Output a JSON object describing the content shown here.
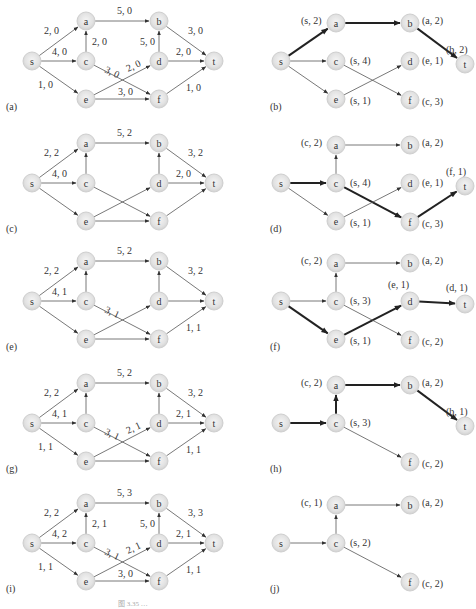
{
  "figure": {
    "caption": "图 3.35 …",
    "panels": [
      {
        "id": "a",
        "label": "(a)",
        "kind": "network",
        "origin": [
          0,
          0
        ],
        "edges": [
          {
            "from": "s",
            "to": "a",
            "label": "2, 0"
          },
          {
            "from": "s",
            "to": "c",
            "label": "4, 0"
          },
          {
            "from": "s",
            "to": "e",
            "label": "1, 0"
          },
          {
            "from": "c",
            "to": "a",
            "label": "2, 0"
          },
          {
            "from": "a",
            "to": "b",
            "label": "5, 0"
          },
          {
            "from": "c",
            "to": "f",
            "label": "3, 0"
          },
          {
            "from": "e",
            "to": "d",
            "label": "2, 0"
          },
          {
            "from": "e",
            "to": "f",
            "label": "3, 0"
          },
          {
            "from": "d",
            "to": "b",
            "label": "5, 0"
          },
          {
            "from": "b",
            "to": "t",
            "label": "3, 0"
          },
          {
            "from": "d",
            "to": "t",
            "label": "2, 0"
          },
          {
            "from": "f",
            "to": "t",
            "label": "1, 0"
          }
        ]
      },
      {
        "id": "b",
        "label": "(b)",
        "kind": "tree",
        "origin": [
          250,
          0
        ],
        "tags": {
          "a": "(s, 2)",
          "b": "(a, 2)",
          "t": "(b, 2)",
          "c": "(s, 4)",
          "d": "(e, 1)",
          "e": "(s, 1)",
          "f": "(c, 3)"
        },
        "nodes": [
          "s",
          "a",
          "b",
          "t",
          "c",
          "d",
          "e",
          "f"
        ],
        "edges": [
          {
            "from": "s",
            "to": "a",
            "bold": true
          },
          {
            "from": "a",
            "to": "b",
            "bold": true
          },
          {
            "from": "b",
            "to": "t",
            "bold": true
          },
          {
            "from": "s",
            "to": "c",
            "bold": false
          },
          {
            "from": "s",
            "to": "e",
            "bold": false
          },
          {
            "from": "c",
            "to": "f",
            "bold": false
          },
          {
            "from": "e",
            "to": "d",
            "bold": false
          }
        ]
      },
      {
        "id": "c",
        "label": "(c)",
        "kind": "network",
        "origin": [
          0,
          122
        ],
        "edges": [
          {
            "from": "s",
            "to": "a",
            "label": "2, 2"
          },
          {
            "from": "s",
            "to": "c",
            "label": "4, 0"
          },
          {
            "from": "s",
            "to": "e",
            "label": ""
          },
          {
            "from": "c",
            "to": "a",
            "label": ""
          },
          {
            "from": "a",
            "to": "b",
            "label": "5, 2"
          },
          {
            "from": "c",
            "to": "f",
            "label": ""
          },
          {
            "from": "e",
            "to": "d",
            "label": ""
          },
          {
            "from": "e",
            "to": "f",
            "label": ""
          },
          {
            "from": "d",
            "to": "b",
            "label": ""
          },
          {
            "from": "b",
            "to": "t",
            "label": "3, 2"
          },
          {
            "from": "d",
            "to": "t",
            "label": "2, 0"
          },
          {
            "from": "f",
            "to": "t",
            "label": ""
          }
        ]
      },
      {
        "id": "d",
        "label": "(d)",
        "kind": "tree",
        "origin": [
          250,
          122
        ],
        "tags": {
          "a": "(c, 2)",
          "b": "(a, 2)",
          "t": "(f, 1)",
          "c": "(s, 4)",
          "d": "(e, 1)",
          "e": "(s, 1)",
          "f": "(c, 3)"
        },
        "nodes": [
          "s",
          "a",
          "b",
          "t",
          "c",
          "d",
          "e",
          "f"
        ],
        "edges": [
          {
            "from": "s",
            "to": "c",
            "bold": true
          },
          {
            "from": "c",
            "to": "f",
            "bold": true
          },
          {
            "from": "f",
            "to": "t",
            "bold": true
          },
          {
            "from": "c",
            "to": "a",
            "bold": false
          },
          {
            "from": "a",
            "to": "b",
            "bold": false
          },
          {
            "from": "s",
            "to": "e",
            "bold": false
          },
          {
            "from": "e",
            "to": "d",
            "bold": false
          }
        ]
      },
      {
        "id": "e",
        "label": "(e)",
        "kind": "network",
        "origin": [
          0,
          240
        ],
        "edges": [
          {
            "from": "s",
            "to": "a",
            "label": "2, 2"
          },
          {
            "from": "s",
            "to": "c",
            "label": "4, 1"
          },
          {
            "from": "s",
            "to": "e",
            "label": ""
          },
          {
            "from": "c",
            "to": "a",
            "label": ""
          },
          {
            "from": "a",
            "to": "b",
            "label": "5, 2"
          },
          {
            "from": "c",
            "to": "f",
            "label": "3, 1"
          },
          {
            "from": "e",
            "to": "d",
            "label": ""
          },
          {
            "from": "e",
            "to": "f",
            "label": ""
          },
          {
            "from": "d",
            "to": "b",
            "label": ""
          },
          {
            "from": "b",
            "to": "t",
            "label": "3, 2"
          },
          {
            "from": "d",
            "to": "t",
            "label": ""
          },
          {
            "from": "f",
            "to": "t",
            "label": "1, 1"
          }
        ]
      },
      {
        "id": "f",
        "label": "(f)",
        "kind": "tree",
        "origin": [
          250,
          240
        ],
        "tags": {
          "a": "(c, 2)",
          "b": "(a, 2)",
          "t": "(d, 1)",
          "c": "(s, 3)",
          "d": "(e, 1)",
          "e": "(s, 1)",
          "f": "(c, 2)"
        },
        "nodes": [
          "s",
          "a",
          "b",
          "t",
          "c",
          "d",
          "e",
          "f"
        ],
        "edges": [
          {
            "from": "s",
            "to": "e",
            "bold": true
          },
          {
            "from": "e",
            "to": "d",
            "bold": true
          },
          {
            "from": "d",
            "to": "t",
            "bold": true
          },
          {
            "from": "s",
            "to": "c",
            "bold": false
          },
          {
            "from": "c",
            "to": "a",
            "bold": false
          },
          {
            "from": "a",
            "to": "b",
            "bold": false
          },
          {
            "from": "c",
            "to": "f",
            "bold": false
          }
        ]
      },
      {
        "id": "g",
        "label": "(g)",
        "kind": "network",
        "origin": [
          0,
          362
        ],
        "edges": [
          {
            "from": "s",
            "to": "a",
            "label": "2, 2"
          },
          {
            "from": "s",
            "to": "c",
            "label": "4, 1"
          },
          {
            "from": "s",
            "to": "e",
            "label": "1, 1"
          },
          {
            "from": "c",
            "to": "a",
            "label": ""
          },
          {
            "from": "a",
            "to": "b",
            "label": "5, 2"
          },
          {
            "from": "c",
            "to": "f",
            "label": "3, 1"
          },
          {
            "from": "e",
            "to": "d",
            "label": "2, 1"
          },
          {
            "from": "e",
            "to": "f",
            "label": ""
          },
          {
            "from": "d",
            "to": "b",
            "label": ""
          },
          {
            "from": "b",
            "to": "t",
            "label": "3, 2"
          },
          {
            "from": "d",
            "to": "t",
            "label": "2, 1"
          },
          {
            "from": "f",
            "to": "t",
            "label": "1, 1"
          }
        ]
      },
      {
        "id": "h",
        "label": "(h)",
        "kind": "tree",
        "origin": [
          250,
          362
        ],
        "tags": {
          "a": "(c, 2)",
          "b": "(a, 2)",
          "t": "(b, 1)",
          "c": "(s, 3)",
          "f": "(c, 2)"
        },
        "nodes": [
          "s",
          "a",
          "b",
          "t",
          "c",
          "f"
        ],
        "edges": [
          {
            "from": "s",
            "to": "c",
            "bold": true
          },
          {
            "from": "c",
            "to": "a",
            "bold": true
          },
          {
            "from": "a",
            "to": "b",
            "bold": true
          },
          {
            "from": "b",
            "to": "t",
            "bold": true
          },
          {
            "from": "c",
            "to": "f",
            "bold": false
          }
        ]
      },
      {
        "id": "i",
        "label": "(i)",
        "kind": "network",
        "origin": [
          0,
          482
        ],
        "edges": [
          {
            "from": "s",
            "to": "a",
            "label": "2, 2"
          },
          {
            "from": "s",
            "to": "c",
            "label": "4, 2"
          },
          {
            "from": "s",
            "to": "e",
            "label": "1, 1"
          },
          {
            "from": "c",
            "to": "a",
            "label": "2, 1"
          },
          {
            "from": "a",
            "to": "b",
            "label": "5, 3"
          },
          {
            "from": "c",
            "to": "f",
            "label": "3, 1"
          },
          {
            "from": "e",
            "to": "d",
            "label": "2, 1"
          },
          {
            "from": "e",
            "to": "f",
            "label": "3, 0"
          },
          {
            "from": "d",
            "to": "b",
            "label": "5, 0"
          },
          {
            "from": "b",
            "to": "t",
            "label": "3, 3"
          },
          {
            "from": "d",
            "to": "t",
            "label": "2, 1"
          },
          {
            "from": "f",
            "to": "t",
            "label": "1, 1"
          }
        ]
      },
      {
        "id": "j",
        "label": "(j)",
        "kind": "tree",
        "origin": [
          250,
          482
        ],
        "tags": {
          "a": "(c, 1)",
          "b": "(a, 2)",
          "c": "(s, 2)",
          "f": "(c, 2)"
        },
        "nodes": [
          "s",
          "a",
          "b",
          "c",
          "f"
        ],
        "edges": [
          {
            "from": "s",
            "to": "c",
            "bold": false
          },
          {
            "from": "c",
            "to": "a",
            "bold": false
          },
          {
            "from": "a",
            "to": "b",
            "bold": false
          },
          {
            "from": "c",
            "to": "f",
            "bold": false
          }
        ]
      }
    ]
  }
}
